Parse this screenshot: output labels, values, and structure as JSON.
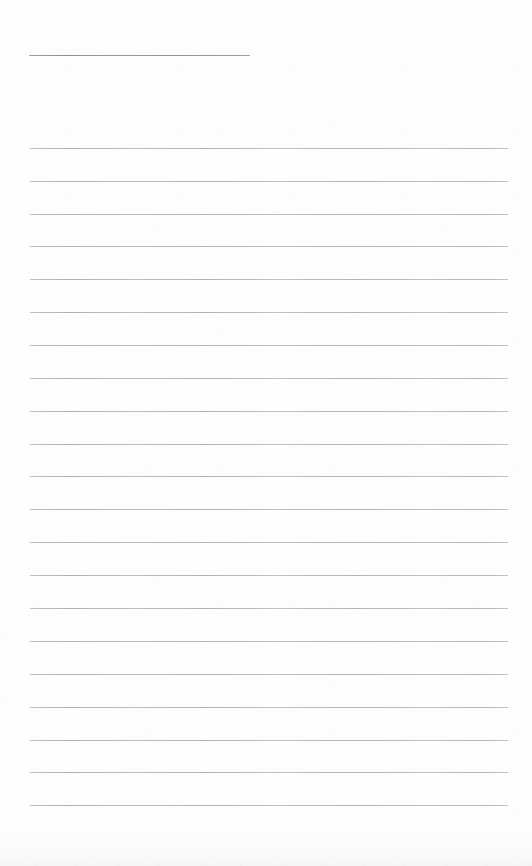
{
  "document": {
    "kind": "scanned-ruled-notepad-page",
    "page_width": 532,
    "page_height": 866,
    "paper_color": "#fdfdfd",
    "rule_color": "#9a9ca4",
    "text_content": "",
    "has_text": false
  },
  "header_rule": {
    "name": "title-rule",
    "x": 29,
    "y": 55,
    "width": 221
  },
  "ruling": {
    "left_margin": 30,
    "right_edge": 508,
    "line_width": 478,
    "line_spacing": 32.85,
    "first_line_y": 148,
    "last_line_y": 805,
    "line_count": 21,
    "line_positions": [
      148,
      181,
      214,
      246,
      279,
      312,
      345,
      378,
      411,
      444,
      476,
      509,
      542,
      575,
      608,
      641,
      674,
      707,
      740,
      772,
      805
    ]
  }
}
